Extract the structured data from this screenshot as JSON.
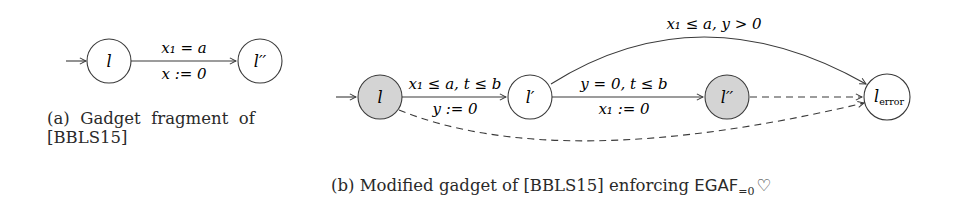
{
  "figure_a": {
    "caption_line1": "(a)  Gadget  fragment  of",
    "caption_line2": "[BBLS15]",
    "nodes": [
      {
        "id": "l",
        "label": "l",
        "filled": false
      },
      {
        "id": "l2",
        "label": "l′′",
        "filled": false
      }
    ],
    "edges": [
      {
        "from": "l",
        "to": "l2",
        "guard": "x₁ = a",
        "reset": "x := 0"
      }
    ]
  },
  "figure_b": {
    "caption_prefix": "(b) Modified gadget of [BBLS15] enforcing ",
    "caption_formula": "EGAF",
    "caption_sub": "=0",
    "caption_symbol": "♡",
    "nodes": [
      {
        "id": "l",
        "label": "l",
        "filled": true
      },
      {
        "id": "lp",
        "label": "l′",
        "filled": false
      },
      {
        "id": "lpp",
        "label": "l′′",
        "filled": true
      },
      {
        "id": "lerr",
        "label": "l",
        "label_sub": "error",
        "filled": false
      }
    ],
    "edges": [
      {
        "from": "l",
        "to": "lp",
        "guard": "x₁ ≤ a, t ≤ b",
        "reset": "y := 0",
        "style": "solid"
      },
      {
        "from": "lp",
        "to": "lpp",
        "guard": "y = 0, t ≤ b",
        "reset": "x₁ := 0",
        "style": "solid"
      },
      {
        "from": "lp",
        "to": "lerr",
        "guard": "x₁ ≤ a, y > 0",
        "style": "solid-curve"
      },
      {
        "from": "lpp",
        "to": "lerr",
        "style": "dashed"
      },
      {
        "from": "l",
        "to": "lerr",
        "style": "dashed-curve"
      }
    ]
  },
  "colors": {
    "stroke": "#3a3a3a",
    "fill_gray": "#d4d4d4",
    "fill_white": "#ffffff"
  }
}
